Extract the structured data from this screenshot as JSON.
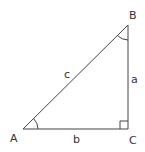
{
  "diagram": {
    "type": "right-triangle",
    "stroke_color": "#444444",
    "background": "#ffffff",
    "vertices": {
      "A": {
        "label": "A",
        "x": 23,
        "y": 129
      },
      "B": {
        "label": "B",
        "x": 128,
        "y": 25
      },
      "C": {
        "label": "C",
        "x": 128,
        "y": 129
      }
    },
    "sides": {
      "a": {
        "label": "a",
        "between": "B-C"
      },
      "b": {
        "label": "b",
        "between": "A-C"
      },
      "c": {
        "label": "c",
        "between": "A-B"
      }
    },
    "angle_marks": [
      "A",
      "B"
    ],
    "right_angle_at": "C"
  }
}
